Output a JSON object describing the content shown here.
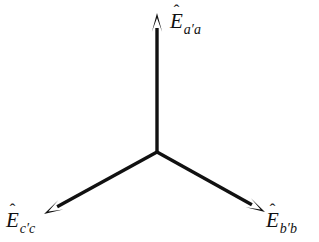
{
  "figure": {
    "name": "three-phase-phasor-diagram",
    "type": "vector-diagram",
    "background_color": "#ffffff",
    "line_color": "#111111",
    "line_width_px": 3,
    "width_px": 319,
    "height_px": 242
  },
  "chart_data": {
    "type": "scatter",
    "title": "",
    "xlabel": "",
    "ylabel": "",
    "grid": false,
    "legend": null,
    "origin": {
      "x": 157,
      "y": 152
    },
    "xlim": [
      0,
      319
    ],
    "ylim": [
      242,
      0
    ],
    "series": [
      {
        "name": "E_a'a",
        "label": "Ê_a'a",
        "angle_deg": 90,
        "tip": {
          "x": 157,
          "y": 13
        },
        "length_px": 139
      },
      {
        "name": "E_b'b",
        "label": "Ê_b'b",
        "angle_deg": -29,
        "tip": {
          "x": 265,
          "y": 212
        },
        "length_px": 124
      },
      {
        "name": "E_c'c",
        "label": "Ê_c'c",
        "angle_deg": -149,
        "tip": {
          "x": 44,
          "y": 214
        },
        "length_px": 132
      }
    ]
  },
  "labels": {
    "a_phase": {
      "symbol": "E",
      "accent": "hat",
      "accent_glyph": "̂",
      "subscript_first": "a",
      "prime": "′",
      "subscript_second": "a",
      "full": "Ê_a′a"
    },
    "b_phase": {
      "symbol": "E",
      "accent": "hat",
      "accent_glyph": "̂",
      "subscript_first": "b",
      "prime": "′",
      "subscript_second": "b",
      "full": "Ê_b′b"
    },
    "c_phase": {
      "symbol": "E",
      "accent": "hat",
      "accent_glyph": "̂",
      "subscript_first": "c",
      "prime": "′",
      "subscript_second": "c",
      "full": "Ê_c′c"
    }
  }
}
